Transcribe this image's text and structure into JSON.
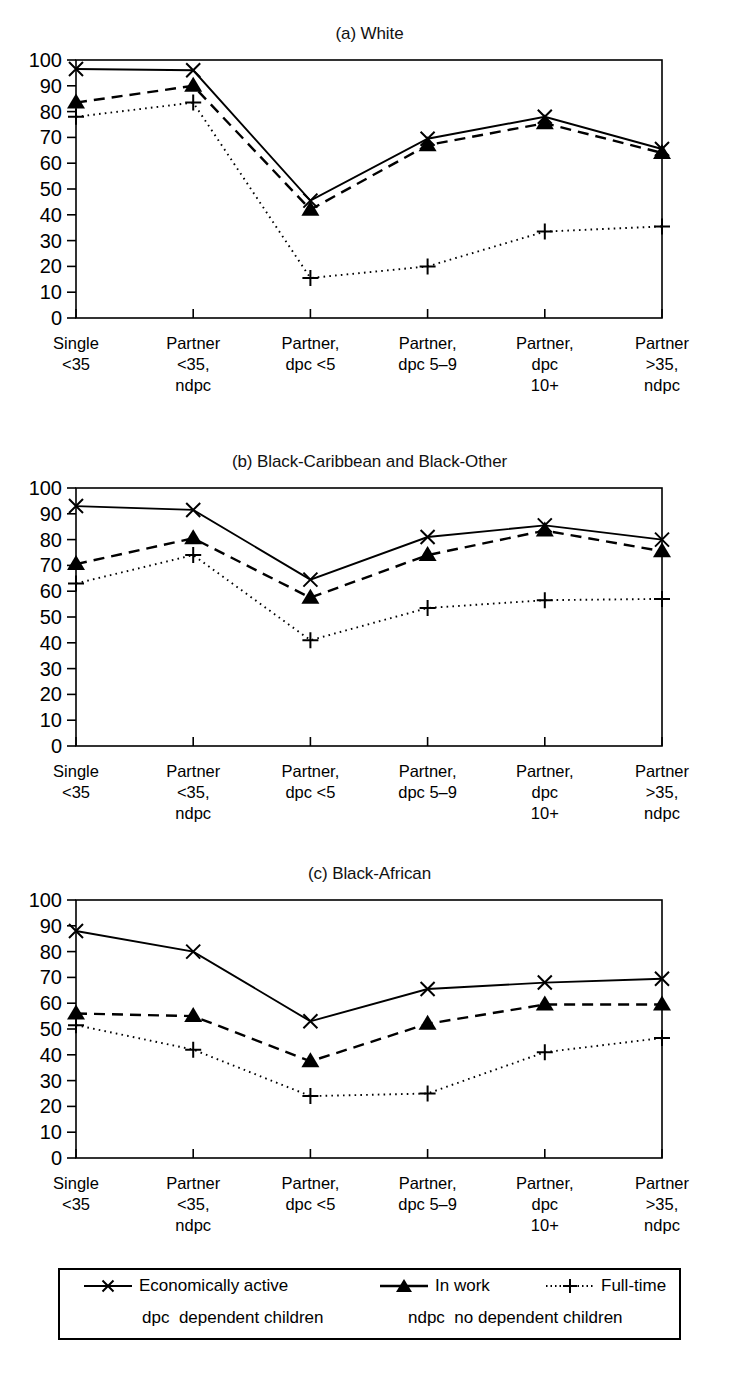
{
  "figure": {
    "panels": [
      {
        "title": "(a) White"
      },
      {
        "title": "(b) Black-Caribbean and Black-Other"
      },
      {
        "title": "(c) Black-African"
      }
    ],
    "legend": {
      "series": [
        {
          "label": "Economically active",
          "marker": "x-marker",
          "line": "solid"
        },
        {
          "label": "In work",
          "marker": "triangle-marker",
          "line": "dashed"
        },
        {
          "label": "Full-time",
          "marker": "plus-marker",
          "line": "dotted"
        }
      ],
      "notes": [
        {
          "abbr": "dpc",
          "text": "dependent children"
        },
        {
          "abbr": "ndpc",
          "text": "no dependent children"
        }
      ]
    },
    "colors": {
      "ink": "#000000",
      "background": "#ffffff"
    }
  },
  "chart_data": [
    {
      "type": "line",
      "title": "(a) White",
      "xlabel": "",
      "ylabel": "",
      "ylim": [
        0,
        100
      ],
      "yticks": [
        0,
        10,
        20,
        30,
        40,
        50,
        60,
        70,
        80,
        90,
        100
      ],
      "grid": false,
      "legend_position": "bottom",
      "categories": [
        "Single\n<35",
        "Partner\n<35,\nndpc",
        "Partner,\ndpc <5",
        "Partner,\ndpc 5–9",
        "Partner,\ndpc\n10+",
        "Partner\n>35,\nndpc"
      ],
      "series": [
        {
          "name": "Economically active",
          "values": [
            96.5,
            96,
            45.5,
            69.5,
            78,
            65.5
          ]
        },
        {
          "name": "In work",
          "values": [
            83.5,
            90,
            42,
            67,
            75.5,
            64
          ]
        },
        {
          "name": "Full-time",
          "values": [
            78,
            83.5,
            15.5,
            20,
            33.5,
            35.5
          ]
        }
      ]
    },
    {
      "type": "line",
      "title": "(b) Black-Caribbean and Black-Other",
      "xlabel": "",
      "ylabel": "",
      "ylim": [
        0,
        100
      ],
      "yticks": [
        0,
        10,
        20,
        30,
        40,
        50,
        60,
        70,
        80,
        90,
        100
      ],
      "grid": false,
      "legend_position": "bottom",
      "categories": [
        "Single\n<35",
        "Partner\n<35,\nndpc",
        "Partner,\ndpc <5",
        "Partner,\ndpc 5–9",
        "Partner,\ndpc\n10+",
        "Partner\n>35,\nndpc"
      ],
      "series": [
        {
          "name": "Economically active",
          "values": [
            93,
            91.5,
            64.5,
            81,
            85.5,
            80
          ]
        },
        {
          "name": "In work",
          "values": [
            70.5,
            80.5,
            57.5,
            74,
            83.5,
            75.5
          ]
        },
        {
          "name": "Full-time",
          "values": [
            63,
            74,
            41,
            53.5,
            56.5,
            57
          ]
        }
      ]
    },
    {
      "type": "line",
      "title": "(c) Black-African",
      "xlabel": "",
      "ylabel": "",
      "ylim": [
        0,
        100
      ],
      "yticks": [
        0,
        10,
        20,
        30,
        40,
        50,
        60,
        70,
        80,
        90,
        100
      ],
      "grid": false,
      "legend_position": "bottom",
      "categories": [
        "Single\n<35",
        "Partner\n<35,\nndpc",
        "Partner,\ndpc <5",
        "Partner,\ndpc 5–9",
        "Partner,\ndpc\n10+",
        "Partner\n>35,\nndpc"
      ],
      "series": [
        {
          "name": "Economically active",
          "values": [
            88,
            80,
            53,
            65.5,
            68,
            69.5
          ]
        },
        {
          "name": "In work",
          "values": [
            56,
            55,
            37.5,
            52,
            59.5,
            59.5
          ]
        },
        {
          "name": "Full-time",
          "values": [
            51.5,
            42,
            24,
            25,
            41,
            46.5
          ]
        }
      ]
    }
  ]
}
